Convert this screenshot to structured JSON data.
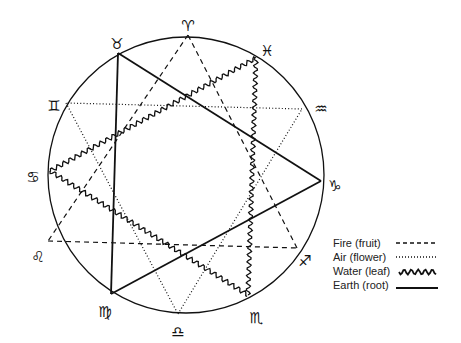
{
  "diagram": {
    "circle": {
      "cx": 186,
      "cy": 175,
      "r": 138
    },
    "signs": [
      {
        "name": "aries",
        "glyph": "♈",
        "vertex": [
          188,
          35
        ],
        "label_pos": [
          188,
          26
        ]
      },
      {
        "name": "taurus",
        "glyph": "♉",
        "vertex": [
          118,
          53
        ],
        "label_pos": [
          117,
          44
        ]
      },
      {
        "name": "gemini",
        "glyph": "♊",
        "vertex": [
          66,
          103
        ],
        "label_pos": [
          54,
          106
        ]
      },
      {
        "name": "cancer",
        "glyph": "♋",
        "vertex": [
          50,
          171
        ],
        "label_pos": [
          33,
          177
        ]
      },
      {
        "name": "leo",
        "glyph": "♌",
        "vertex": [
          48,
          241
        ],
        "label_pos": [
          38,
          257
        ]
      },
      {
        "name": "virgo",
        "glyph": "♍",
        "vertex": [
          111,
          294
        ],
        "label_pos": [
          105,
          312
        ]
      },
      {
        "name": "libra",
        "glyph": "♎",
        "vertex": [
          178,
          314
        ],
        "label_pos": [
          178,
          332
        ]
      },
      {
        "name": "scorpio",
        "glyph": "♏",
        "vertex": [
          248,
          295
        ],
        "label_pos": [
          256,
          318
        ]
      },
      {
        "name": "sagittarius",
        "glyph": "♐",
        "vertex": [
          297,
          248
        ],
        "label_pos": [
          305,
          261
        ]
      },
      {
        "name": "capricorn",
        "glyph": "♑",
        "vertex": [
          321,
          181
        ],
        "label_pos": [
          335,
          186
        ]
      },
      {
        "name": "aquarius",
        "glyph": "♒",
        "vertex": [
          302,
          109
        ],
        "label_pos": [
          321,
          109
        ]
      },
      {
        "name": "pisces",
        "glyph": "♓",
        "vertex": [
          256,
          58
        ],
        "label_pos": [
          267,
          51
        ]
      }
    ],
    "triangles": [
      {
        "element": "Fire",
        "vertices": [
          "aries",
          "leo",
          "sagittarius"
        ],
        "style": "dashed"
      },
      {
        "element": "Air",
        "vertices": [
          "gemini",
          "libra",
          "aquarius"
        ],
        "style": "dotted"
      },
      {
        "element": "Water",
        "vertices": [
          "cancer",
          "scorpio",
          "pisces"
        ],
        "style": "wavy"
      },
      {
        "element": "Earth",
        "vertices": [
          "taurus",
          "virgo",
          "capricorn"
        ],
        "style": "solid"
      }
    ]
  },
  "legend": {
    "items": [
      {
        "label": "Fire (fruit)",
        "style": "dashed"
      },
      {
        "label": "Air (flower)",
        "style": "dotted"
      },
      {
        "label": "Water (leaf)",
        "style": "wavy"
      },
      {
        "label": "Earth (root)",
        "style": "solid"
      }
    ]
  }
}
